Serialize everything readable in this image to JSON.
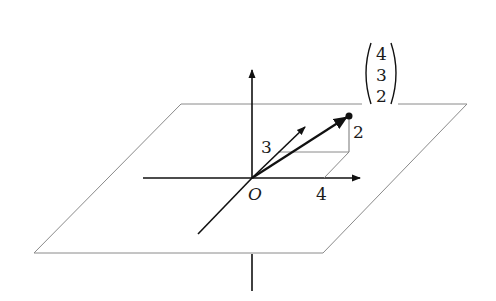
{
  "figure": {
    "type": "3d-vector-diagram",
    "origin_label": "O",
    "x_component_label": "4",
    "y_component_label": "3",
    "z_component_label": "2",
    "vector": {
      "components": [
        "4",
        "3",
        "2"
      ]
    },
    "colors": {
      "stroke": "#111111",
      "thin_stroke": "#8a8a8a",
      "background": "#ffffff"
    }
  }
}
